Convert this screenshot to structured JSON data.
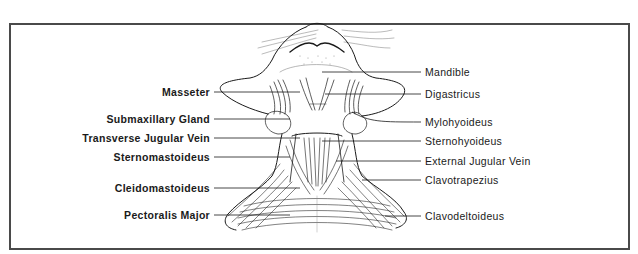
{
  "figure": {
    "frame_color": "#4a4a4a",
    "ink_color": "#1a1a1a"
  },
  "labels": {
    "left": [
      {
        "text": "Masseter",
        "y": 86,
        "line_to_x": 300,
        "line_y": 92
      },
      {
        "text": "Submaxillary Gland",
        "y": 113,
        "line_to_x": 290,
        "line_y": 119
      },
      {
        "text": "Transverse Jugular Vein",
        "y": 132,
        "line_to_x": 300,
        "line_y": 138
      },
      {
        "text": "Sternomastoideus",
        "y": 151,
        "line_to_x": 290,
        "line_y": 157
      },
      {
        "text": "Cleidomastoideus",
        "y": 182,
        "line_to_x": 300,
        "line_y": 188
      },
      {
        "text": "Pectoralis Major",
        "y": 209,
        "line_to_x": 290,
        "line_y": 215
      }
    ],
    "right": [
      {
        "text": "Mandible",
        "y": 66,
        "line_from_x": 322,
        "line_y": 72
      },
      {
        "text": "Digastricus",
        "y": 88,
        "line_from_x": 325,
        "line_y": 94
      },
      {
        "text": "Mylohyoideus",
        "y": 116,
        "line_from_x": 352,
        "line_y": 122
      },
      {
        "text": "Sternohyoideus",
        "y": 135,
        "line_from_x": 322,
        "line_y": 141
      },
      {
        "text": "External Jugular Vein",
        "y": 155,
        "line_from_x": 336,
        "line_y": 161
      },
      {
        "text": "Clavotrapezius",
        "y": 174,
        "line_from_x": 362,
        "line_y": 180
      },
      {
        "text": "Clavodeltoideus",
        "y": 210,
        "line_from_x": 385,
        "line_y": 216
      }
    ]
  }
}
